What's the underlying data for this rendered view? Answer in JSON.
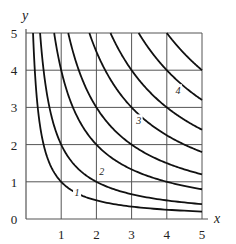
{
  "chart_data": {
    "type": "line",
    "title": "",
    "xlabel": "x",
    "ylabel": "y",
    "xlim": [
      0,
      5
    ],
    "ylim": [
      0,
      5
    ],
    "grid": true,
    "x_ticks": [
      "1",
      "2",
      "3",
      "4",
      "5"
    ],
    "y_ticks": [
      "0",
      "1",
      "2",
      "3",
      "4",
      "5"
    ],
    "series": [
      {
        "name": "xy=1",
        "c": 1,
        "label": "1",
        "label_pos": [
          1.45,
          0.72
        ]
      },
      {
        "name": "xy=2",
        "c": 2,
        "label": "",
        "label_pos": null
      },
      {
        "name": "xy=4",
        "c": 4,
        "label": "2",
        "label_pos": [
          2.15,
          1.28
        ]
      },
      {
        "name": "xy=6",
        "c": 6,
        "label": "",
        "label_pos": null
      },
      {
        "name": "xy=9",
        "c": 9,
        "label": "3",
        "label_pos": [
          3.2,
          2.65
        ]
      },
      {
        "name": "xy=12",
        "c": 12,
        "label": "",
        "label_pos": null
      },
      {
        "name": "xy=16",
        "c": 16,
        "label": "4",
        "label_pos": [
          4.32,
          3.46
        ]
      },
      {
        "name": "xy=20",
        "c": 20,
        "label": "",
        "label_pos": null
      }
    ]
  },
  "colors": {
    "curve": "#111111",
    "grid": "#555555",
    "text": "#222222"
  }
}
